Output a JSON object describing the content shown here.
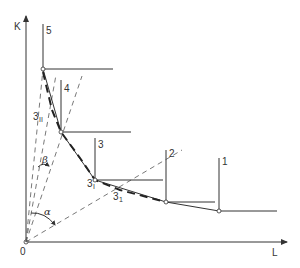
{
  "diagram": {
    "axes": {
      "y_label": "K",
      "x_label": "L",
      "origin_label": "0"
    },
    "isoquant_points": [
      {
        "label": "5",
        "x": 43,
        "y": 69,
        "top": 24,
        "right": 113
      },
      {
        "label": "4",
        "x": 61,
        "y": 132,
        "top": 80,
        "right": 131
      },
      {
        "label": "3",
        "x": 95,
        "y": 180,
        "top": 138,
        "right": 163
      },
      {
        "label": "2",
        "x": 166,
        "y": 202,
        "top": 150,
        "right": 215
      },
      {
        "label": "1",
        "x": 219,
        "y": 211,
        "top": 158,
        "right": 277
      }
    ],
    "intermediate_labels": {
      "three_ii": "3",
      "three_ii_sub": "II",
      "three_i": "3",
      "three_i_sub": "I",
      "three_1": "3",
      "three_1_sub": "1"
    },
    "angles": {
      "alpha": "α",
      "beta": "β"
    },
    "colors": {
      "line": "#333333",
      "background": "#ffffff"
    }
  }
}
